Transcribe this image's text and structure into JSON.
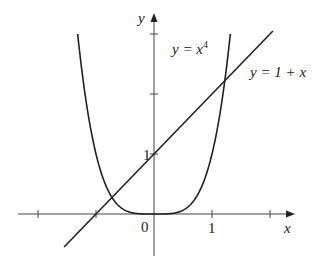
{
  "chart_data": {
    "type": "line",
    "title": "",
    "xlabel": "x",
    "ylabel": "y",
    "xlim": [
      -2.3,
      2.4
    ],
    "ylim": [
      -0.7,
      3.3
    ],
    "grid": false,
    "legend": "none",
    "x_ticks": [
      -2,
      -1,
      0,
      1,
      2
    ],
    "x_tick_labels": [
      "",
      "",
      "0",
      "1",
      ""
    ],
    "y_ticks": [
      1,
      2,
      3
    ],
    "y_tick_labels": [
      "1",
      "",
      ""
    ],
    "series": [
      {
        "name": "y = x^4",
        "label_main": "y = x",
        "label_sup": "4",
        "function": "x^4",
        "x": [
          -1.316,
          -1.2,
          -1.0,
          -0.8,
          -0.6,
          -0.4,
          -0.2,
          0,
          0.2,
          0.4,
          0.6,
          0.8,
          1.0,
          1.2,
          1.316
        ],
        "y": [
          3.0,
          2.0736,
          1.0,
          0.4096,
          0.1296,
          0.0256,
          0.0016,
          0,
          0.0016,
          0.0256,
          0.1296,
          0.4096,
          1.0,
          2.0736,
          3.0
        ]
      },
      {
        "name": "y = 1 + x",
        "label_main": "y = 1 + x",
        "function": "1 + x",
        "x": [
          -1.55,
          2.05
        ],
        "y": [
          -0.55,
          3.05
        ]
      }
    ],
    "annotations": [
      {
        "text": "y = x^4",
        "near": [
          0.35,
          2.9
        ]
      },
      {
        "text": "y = 1 + x",
        "near": [
          1.75,
          2.25
        ]
      }
    ]
  },
  "axes": {
    "x_label": "x",
    "y_label": "y",
    "origin_label": "0",
    "x_one_label": "1",
    "y_one_label": "1"
  },
  "colors": {
    "curve": "#222222",
    "axis": "#444444",
    "background": "#ffffff"
  }
}
